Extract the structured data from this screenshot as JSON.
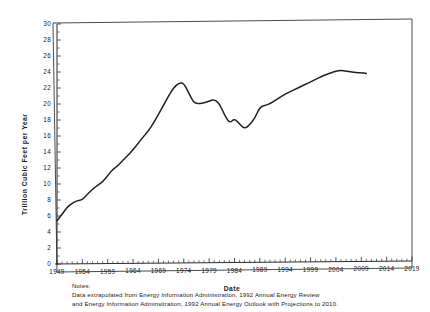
{
  "chart_data": {
    "type": "line",
    "title": "",
    "xlabel": "Date",
    "ylabel": "Trillion  Cubic  Feet  per  Year",
    "xlim": [
      1949,
      2019
    ],
    "ylim": [
      0,
      30
    ],
    "grid": false,
    "legend": "none",
    "xticks": [
      1949,
      1954,
      1959,
      1964,
      1969,
      1974,
      1979,
      1984,
      1989,
      1994,
      1999,
      2004,
      2009,
      2014,
      2019
    ],
    "xtick_labels": [
      "1949",
      "1954",
      "1959",
      "1964",
      "1969",
      "1974",
      "1979",
      "1984",
      "1989",
      "1994",
      "1999",
      "2004",
      "2009",
      "2014",
      "2019"
    ],
    "yticks": [
      0,
      2,
      4,
      6,
      8,
      10,
      12,
      14,
      16,
      18,
      20,
      22,
      24,
      26,
      28,
      30
    ],
    "ytick_labels": [
      "0",
      "2",
      "4",
      "6",
      "8",
      "10",
      "12",
      "14",
      "16",
      "18",
      "20",
      "22",
      "24",
      "26",
      "28",
      "30"
    ],
    "x": [
      1949,
      1950,
      1951,
      1952,
      1953,
      1954,
      1955,
      1956,
      1957,
      1958,
      1959,
      1960,
      1961,
      1962,
      1963,
      1964,
      1965,
      1966,
      1967,
      1968,
      1969,
      1970,
      1971,
      1972,
      1973,
      1974,
      1975,
      1976,
      1977,
      1978,
      1979,
      1980,
      1981,
      1982,
      1983,
      1984,
      1985,
      1986,
      1987,
      1988,
      1989,
      1990,
      1991,
      1992,
      1993,
      1994,
      1995,
      1996,
      1997,
      1998,
      1999,
      2000,
      2001,
      2002,
      2003,
      2004,
      2005,
      2006,
      2007,
      2008,
      2009,
      2010
    ],
    "values": [
      5.4,
      6.2,
      7.1,
      7.6,
      7.9,
      8.0,
      8.7,
      9.3,
      9.8,
      10.2,
      11.0,
      11.8,
      12.2,
      12.9,
      13.5,
      14.2,
      15.0,
      15.8,
      16.5,
      17.5,
      18.6,
      19.7,
      20.9,
      21.9,
      22.5,
      22.5,
      21.2,
      20.0,
      19.9,
      20.0,
      20.2,
      20.4,
      19.9,
      18.5,
      17.4,
      18.0,
      17.3,
      16.7,
      17.2,
      18.0,
      19.4,
      19.6,
      19.8,
      20.2,
      20.6,
      21.0,
      21.3,
      21.6,
      21.9,
      22.2,
      22.5,
      22.8,
      23.1,
      23.4,
      23.6,
      23.8,
      23.9,
      23.8,
      23.7,
      23.6,
      23.6,
      23.5
    ]
  },
  "notes": {
    "label": "Notes:",
    "line1": "Data extrapolated from Energy Information Administration, 1992 Annual Energy Review",
    "line2": "and Energy Information Adminsitration, 1992 Annual Energy Outlook with Projections to 2010."
  }
}
